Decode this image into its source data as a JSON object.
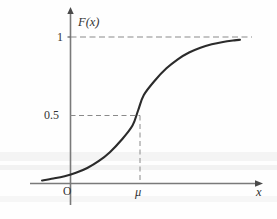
{
  "figure": {
    "background_color": "#fefefe",
    "ink_color": "#333333",
    "curve_color": "#2b2b2b"
  },
  "axes": {
    "y_axis_label": "F(x)",
    "x_axis_label": "x",
    "origin_label": "O"
  },
  "ticks": {
    "y": [
      {
        "label": "1",
        "value": 1
      },
      {
        "label": "0.5",
        "value": 0.5
      }
    ],
    "x": [
      {
        "label": "μ",
        "value": 0
      }
    ]
  },
  "guides": [
    {
      "name": "asymptote-one",
      "orientation": "horizontal",
      "at": 1,
      "style": "dashed"
    },
    {
      "name": "median-horizontal",
      "orientation": "horizontal",
      "at": 0.5,
      "style": "dashed"
    },
    {
      "name": "median-vertical",
      "orientation": "vertical",
      "at": "μ",
      "style": "dashed"
    }
  ],
  "chart_data": {
    "type": "line",
    "title": "",
    "xlabel": "x",
    "ylabel": "F(x)",
    "xlim": [
      -3.4,
      3.6
    ],
    "ylim": [
      0,
      1.08
    ],
    "grid": false,
    "legend": null,
    "annotations": [
      {
        "text": "1",
        "x": null,
        "y": 1
      },
      {
        "text": "0.5",
        "x": 0,
        "y": 0.5
      },
      {
        "text": "μ",
        "x": 0,
        "y": 0
      },
      {
        "text": "O",
        "x": null,
        "y": null
      },
      {
        "text": "F(x)",
        "x": null,
        "y": null
      },
      {
        "text": "x",
        "x": null,
        "y": null
      }
    ],
    "series": [
      {
        "name": "F(x)",
        "x": [
          -3.4,
          -3.0,
          -2.6,
          -2.2,
          -1.8,
          -1.4,
          -1.0,
          -0.6,
          -0.2,
          0.0,
          0.2,
          0.6,
          1.0,
          1.4,
          1.8,
          2.2,
          2.6,
          3.0,
          3.4,
          3.6
        ],
        "values": [
          0.021,
          0.034,
          0.05,
          0.073,
          0.106,
          0.152,
          0.214,
          0.295,
          0.396,
          0.5,
          0.604,
          0.705,
          0.786,
          0.848,
          0.894,
          0.927,
          0.95,
          0.966,
          0.977,
          0.981
        ]
      }
    ]
  }
}
